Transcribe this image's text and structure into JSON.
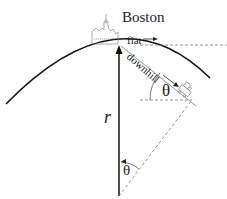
{
  "diagram": {
    "labels": {
      "city": "Boston",
      "flat": "flat",
      "downhill": "downhill",
      "angle_at_train": "θ",
      "radius": "r",
      "angle_at_center": "θ"
    },
    "colors": {
      "stroke": "#111111",
      "dashed": "#777777",
      "building": "#888888"
    },
    "geometry": {
      "earth_center": [
        119,
        196
      ],
      "earth_radius": 151,
      "boston_point": [
        119,
        45
      ],
      "train_point": [
        190,
        100
      ]
    }
  }
}
